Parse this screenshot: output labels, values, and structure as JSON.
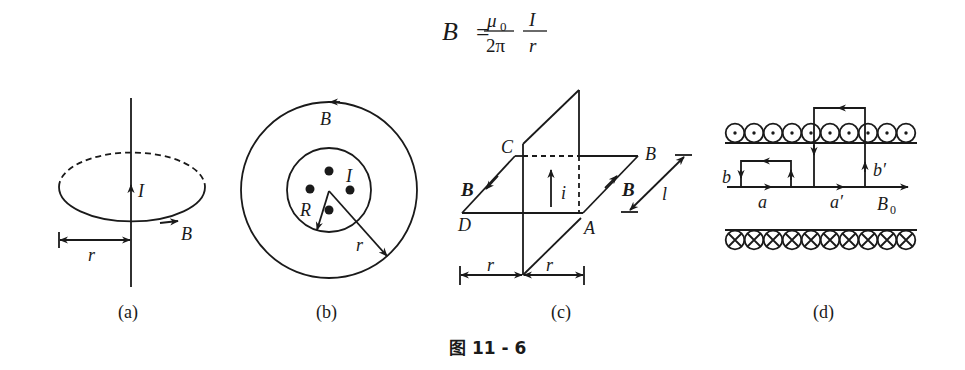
{
  "formula": {
    "lhs": "B",
    "equals": "=",
    "frac1_num": "μ",
    "frac1_num_sub": "0",
    "frac1_den": "2π",
    "frac2_num": "I",
    "frac2_den": "r"
  },
  "panels": {
    "a": {
      "caption": "(a)",
      "labels": {
        "current": "I",
        "field": "B",
        "radius": "r"
      }
    },
    "b": {
      "caption": "(b)",
      "labels": {
        "field": "B",
        "current": "I",
        "inner_radius": "R",
        "radius": "r"
      }
    },
    "c": {
      "caption": "(c)",
      "labels": {
        "corner_c": "C",
        "corner_b": "B",
        "corner_d": "D",
        "corner_a": "A",
        "field_left": "B",
        "field_right": "B",
        "current": "i",
        "length": "l",
        "radius_left": "r",
        "radius_right": "r"
      }
    },
    "d": {
      "caption": "(d)",
      "labels": {
        "b": "b",
        "b_prime": "b′",
        "a": "a",
        "a_prime": "a′",
        "field": "B",
        "field_sub": "0"
      },
      "top_coil_count": 10,
      "bottom_coil_count": 10
    }
  },
  "figure_caption": "图 11 - 6"
}
